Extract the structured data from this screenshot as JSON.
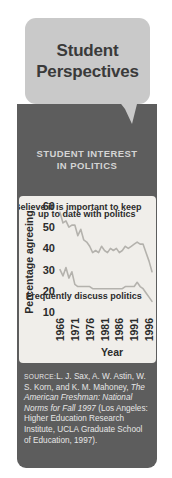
{
  "title": {
    "line1": "Student",
    "line2": "Perspectives"
  },
  "subtitle": {
    "line1": "STUDENT INTEREST",
    "line2": "IN POLITICS"
  },
  "source": {
    "label": "SOURCE:",
    "text": "L. J. Sax, A. W. Astin, W. S. Korn, and K. M. Mahoney, ",
    "italic": "The American Freshman: National Norms for Fall 1997",
    "tail": " (Los Angeles: Higher Education Research Institute, UCLA Graduate School of Education, 1997)."
  },
  "colors": {
    "panel": "#5d5d5d",
    "bubble": "#c9c9c9",
    "card": "#f0eeea",
    "line": "#b4b2ad",
    "axis": "#2b2b2b",
    "title_text": "#3a3a3a",
    "subtitle_text": "#d4d4d4"
  },
  "chart_data": {
    "type": "line",
    "title": "",
    "xlabel": "Year",
    "ylabel": "Percentage agreeing",
    "xlim": [
      1966,
      1997
    ],
    "ylim": [
      10,
      60
    ],
    "ytick_labels": [
      "60",
      "50",
      "40",
      "30",
      "20",
      "10"
    ],
    "yticks": [
      60,
      50,
      40,
      30,
      20,
      10
    ],
    "xtick_labels": [
      "1966",
      "1971",
      "1976",
      "1981",
      "1986",
      "1991",
      "1996"
    ],
    "xticks": [
      1966,
      1971,
      1976,
      1981,
      1986,
      1991,
      1996
    ],
    "grid": false,
    "legend": "annotations",
    "x": [
      1966,
      1967,
      1968,
      1969,
      1970,
      1971,
      1972,
      1973,
      1974,
      1975,
      1976,
      1977,
      1978,
      1979,
      1980,
      1981,
      1982,
      1983,
      1984,
      1985,
      1986,
      1987,
      1988,
      1989,
      1990,
      1991,
      1992,
      1993,
      1994,
      1995,
      1996,
      1997
    ],
    "series": [
      {
        "name": "Believe it is important to keep up to date with politics",
        "annotation": "Believe it is important to keep\nup to date with politics",
        "values": [
          57,
          52,
          53,
          50,
          51,
          51,
          46,
          49,
          44,
          43,
          41,
          38,
          39,
          38,
          41,
          39,
          38,
          40,
          39,
          40,
          38,
          39,
          41,
          40,
          41,
          42,
          43,
          42,
          42,
          38,
          34,
          29
        ]
      },
      {
        "name": "Frequently discuss politics",
        "annotation": "Frequently discuss politics",
        "values": [
          30,
          27,
          31,
          26,
          29,
          23,
          22,
          22,
          22,
          22,
          22,
          21,
          21,
          21,
          21,
          21,
          21,
          21,
          21,
          21,
          21,
          21,
          22,
          22,
          22,
          22,
          24,
          22,
          21,
          19,
          17,
          15
        ]
      }
    ],
    "annotations": [
      {
        "text": "Believe it is important to keep",
        "x": 1972,
        "y": 58
      },
      {
        "text": "up to date with politics",
        "x": 1975,
        "y": 55
      },
      {
        "text": "Frequently discuss politics",
        "x": 1974,
        "y": 16
      }
    ]
  }
}
